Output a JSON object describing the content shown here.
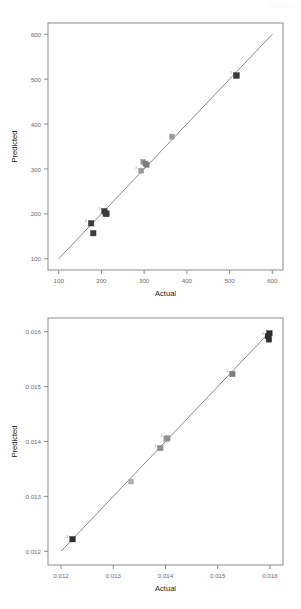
{
  "page": {
    "background_color": "#ffffff",
    "width": 301,
    "height": 609
  },
  "charts": [
    {
      "id": "chart-top",
      "name": "actual-vs-predicted-scatter-top",
      "xlabel": "Actual",
      "ylabel": "Predicted",
      "xticks": [
        "100",
        "200",
        "300",
        "400",
        "500",
        "600"
      ],
      "yticks": [
        "100",
        "200",
        "300",
        "400",
        "500",
        "600"
      ]
    },
    {
      "id": "chart-bottom",
      "name": "actual-vs-predicted-scatter-bottom",
      "xlabel": "Actual",
      "ylabel": "Predicted",
      "xticks": [
        "0.012",
        "0.013",
        "0.014",
        "0.015",
        "0.016"
      ],
      "yticks": [
        "0.012",
        "0.013",
        "0.014",
        "0.015",
        "0.016"
      ]
    }
  ],
  "chart_data": [
    {
      "type": "scatter",
      "title": "",
      "xlabel": "Actual",
      "ylabel": "Predicted",
      "xlim": [
        75,
        625
      ],
      "ylim": [
        75,
        625
      ],
      "xticks": [
        100,
        200,
        300,
        400,
        500,
        600
      ],
      "yticks": [
        100,
        200,
        300,
        400,
        500,
        600
      ],
      "grid": false,
      "legend": "none",
      "reference_line": {
        "type": "identity",
        "from": [
          100,
          100
        ],
        "to": [
          600,
          600
        ],
        "color": "#7a7a7a"
      },
      "series": [
        {
          "name": "observations",
          "points": [
            {
              "x": 176,
              "y": 179,
              "label": "4",
              "color": "#3a3a3a",
              "size": 5.5
            },
            {
              "x": 181,
              "y": 157,
              "label": "",
              "color": "#3a3a3a",
              "size": 5.5
            },
            {
              "x": 207,
              "y": 206,
              "label": "3",
              "color": "#3a3a3a",
              "size": 5.5
            },
            {
              "x": 210,
              "y": 201,
              "label": "",
              "color": "#3a3a3a",
              "size": 5.5
            },
            {
              "x": 212,
              "y": 200,
              "label": "",
              "color": "#3a3a3a",
              "size": 5.5
            },
            {
              "x": 293,
              "y": 296,
              "label": "4",
              "color": "#9a9a9a",
              "size": 5.0
            },
            {
              "x": 298,
              "y": 316,
              "label": "",
              "color": "#9a9a9a",
              "size": 5.0
            },
            {
              "x": 303,
              "y": 312,
              "label": "",
              "color": "#7d7d7d",
              "size": 5.0
            },
            {
              "x": 306,
              "y": 309,
              "label": "",
              "color": "#7d7d7d",
              "size": 5.0
            },
            {
              "x": 365,
              "y": 372,
              "label": "",
              "color": "#9a9a9a",
              "size": 5.0
            },
            {
              "x": 516,
              "y": 508,
              "label": "5",
              "color": "#3a3a3a",
              "size": 6.0
            }
          ]
        }
      ]
    },
    {
      "type": "scatter",
      "title": "",
      "xlabel": "Actual",
      "ylabel": "Predicted",
      "xlim": [
        0.01175,
        0.01625
      ],
      "ylim": [
        0.01175,
        0.01625
      ],
      "xticks": [
        0.012,
        0.013,
        0.014,
        0.015,
        0.016
      ],
      "yticks": [
        0.012,
        0.013,
        0.014,
        0.015,
        0.016
      ],
      "grid": false,
      "legend": "none",
      "reference_line": {
        "type": "identity",
        "from": [
          0.012,
          0.012
        ],
        "to": [
          0.016,
          0.016
        ],
        "color": "#7a7a7a"
      },
      "series": [
        {
          "name": "observations",
          "points": [
            {
              "x": 0.01222,
              "y": 0.01222,
              "label": "5",
              "color": "#2e2e2e",
              "size": 5.5
            },
            {
              "x": 0.01334,
              "y": 0.01327,
              "label": "",
              "color": "#b0b0b0",
              "size": 5.0
            },
            {
              "x": 0.0139,
              "y": 0.01388,
              "label": "3",
              "color": "#8f8f8f",
              "size": 5.5
            },
            {
              "x": 0.01402,
              "y": 0.01405,
              "label": "4",
              "color": "#9d9d9d",
              "size": 5.5
            },
            {
              "x": 0.01404,
              "y": 0.01406,
              "label": "",
              "color": "#8f8f8f",
              "size": 5.0
            },
            {
              "x": 0.01528,
              "y": 0.01523,
              "label": "5",
              "color": "#7e7e7e",
              "size": 5.5
            },
            {
              "x": 0.01596,
              "y": 0.01592,
              "label": "4",
              "color": "#2e2e2e",
              "size": 5.5
            },
            {
              "x": 0.01598,
              "y": 0.01586,
              "label": "",
              "color": "#2e2e2e",
              "size": 5.5
            },
            {
              "x": 0.01599,
              "y": 0.01597,
              "label": "",
              "color": "#2e2e2e",
              "size": 5.5
            }
          ]
        }
      ]
    }
  ]
}
